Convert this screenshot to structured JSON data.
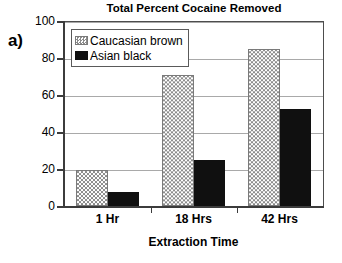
{
  "panel": {
    "label": "a)"
  },
  "chart_data": {
    "type": "bar",
    "title": "Total Percent Cocaine Removed",
    "xlabel": "Extraction Time",
    "ylabel": "",
    "categories": [
      "1 Hr",
      "18 Hrs",
      "42 Hrs"
    ],
    "series": [
      {
        "name": "Caucasian brown",
        "pattern": "checkered",
        "color": "#ffffff",
        "pattern_color": "#8c8c8c",
        "values": [
          19.5,
          71,
          85
        ]
      },
      {
        "name": "Asian black",
        "pattern": "solid",
        "color": "#101010",
        "pattern_color": "#101010",
        "values": [
          7.5,
          25,
          52.5
        ]
      }
    ],
    "ylim": [
      0,
      100
    ],
    "yticks": [
      0,
      20,
      40,
      60,
      80,
      100
    ],
    "ytick_labels": [
      "0",
      "20",
      "40",
      "60",
      "80",
      "100"
    ],
    "grid": true,
    "grid_axis": "y",
    "legend_position": "top-left-inside",
    "bar_group_gap": true,
    "bars_adjacent_within_group": true
  },
  "legend": {
    "entries": [
      {
        "label": "Caucasian brown",
        "swatch": "checkered-swatch"
      },
      {
        "label": "Asian black",
        "swatch": "solid-black-swatch"
      }
    ]
  }
}
